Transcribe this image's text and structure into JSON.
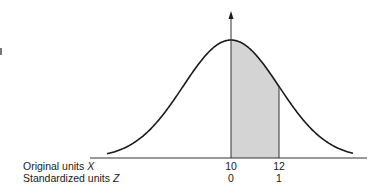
{
  "chart_data": {
    "type": "area",
    "title": "",
    "curve": "normal density",
    "shaded_region": {
      "x_from": 10,
      "x_to": 12,
      "z_from": 0,
      "z_to": 1,
      "fill": "#d4d4d4"
    },
    "axes": [
      {
        "label": "Original units X",
        "ticks": [
          {
            "value": "10"
          },
          {
            "value": "12"
          }
        ]
      },
      {
        "label": "Standardized units Z",
        "ticks": [
          {
            "value": "0"
          },
          {
            "value": "1"
          }
        ]
      }
    ],
    "mean": 10,
    "std_dev": 2,
    "vertical_axis_arrow_at": 10,
    "grid": false,
    "legend": null
  },
  "labels": {
    "x_row_label": "Original units",
    "x_row_var": "X",
    "z_row_label": "Standardized units",
    "z_row_var": "Z",
    "x_tick_mean": "10",
    "x_tick_plus1": "12",
    "z_tick_mean": "0",
    "z_tick_plus1": "1"
  },
  "colors": {
    "line": "#1a1a1a",
    "shade": "#d4d4d4",
    "background": "#ffffff"
  }
}
